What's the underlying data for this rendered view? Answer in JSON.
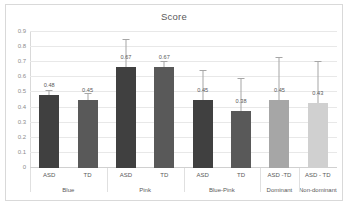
{
  "chart_data": {
    "type": "bar",
    "title": "Score",
    "xlabel": "",
    "ylabel": "",
    "ylim": [
      0,
      0.9
    ],
    "ytick_labels": [
      "0.9",
      "0.8",
      "0.7",
      "0.6",
      "0.5",
      "0.4",
      "0.3",
      "0.2",
      "0.1",
      "0"
    ],
    "ytick_values": [
      0.9,
      0.8,
      0.7,
      0.6,
      0.5,
      0.4,
      0.3,
      0.2,
      0.1,
      0
    ],
    "grid": true,
    "legend": "none",
    "categories": [
      "ASD",
      "TD",
      "ASD",
      "TD",
      "ASD",
      "TD",
      "ASD -TD",
      "ASD - TD"
    ],
    "group_labels": [
      "Blue",
      "Pink",
      "Blue-Pink",
      "Dominant",
      "Non-dominant"
    ],
    "groups": [
      {
        "label": "Blue",
        "members": [
          0,
          1
        ]
      },
      {
        "label": "Pink",
        "members": [
          2,
          3
        ]
      },
      {
        "label": "Blue-Pink",
        "members": [
          4,
          5
        ]
      },
      {
        "label": "Dominant",
        "members": [
          6
        ]
      },
      {
        "label": "Non-dominant",
        "members": [
          7
        ]
      }
    ],
    "values": [
      0.48,
      0.45,
      0.67,
      0.67,
      0.45,
      0.38,
      0.45,
      0.43
    ],
    "data_labels": [
      "0.48",
      "0.45",
      "0.67",
      "0.67",
      "0.45",
      "0.38",
      "0.45",
      "0.43"
    ],
    "error_high": [
      0.51,
      0.49,
      0.85,
      0.7,
      0.64,
      0.59,
      0.73,
      0.7
    ],
    "bar_colors": [
      "#404040",
      "#595959",
      "#404040",
      "#595959",
      "#404040",
      "#595959",
      "#A6A6A6",
      "#D0D0D0"
    ],
    "error_color": "#A6A6A6"
  },
  "colors": {
    "frame": "#D9D9D9",
    "gridline": "#E8E8E8",
    "text": "#595959",
    "tick_text": "#8C8C8C",
    "background": "#FFFFFF"
  }
}
